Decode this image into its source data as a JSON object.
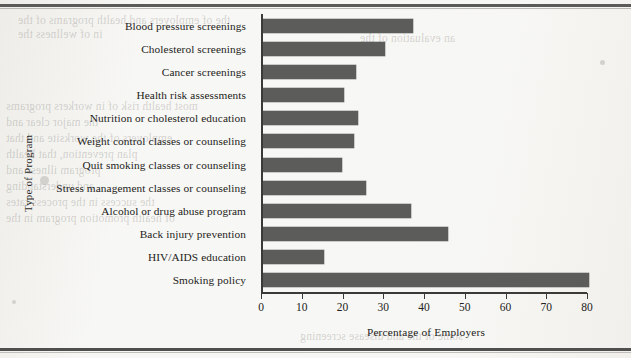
{
  "page": {
    "background_color": "#f7f7f5",
    "border_color": "#5a5a58",
    "ghost_text": [
      "the of employers and health programs of the",
      "in of wellness the",
      "most health risk of in workers programs",
      "the major clear and",
      "employers of the worksite and that",
      "plan prevention, that health",
      "program illness and",
      "and understanding",
      "the success in the process rates",
      "of health promotion program in the",
      "some of the and disease screening",
      "was in the of the",
      "an evaluation of the"
    ]
  },
  "chart_data": {
    "type": "bar",
    "orientation": "horizontal",
    "title": "",
    "xlabel": "Percentage of Employers",
    "ylabel": "Type of Program",
    "xlim": [
      0,
      80
    ],
    "xticks": [
      0,
      10,
      20,
      30,
      40,
      50,
      60,
      70,
      80
    ],
    "grid": false,
    "legend": false,
    "bar_color": "#5c5c5a",
    "categories": [
      "Blood pressure screenings",
      "Cholesterol screenings",
      "Cancer screenings",
      "Health risk assessments",
      "Nutrition or cholesterol education",
      "Weight control classes or counseling",
      "Quit smoking classes or counseling",
      "Stress management classes or counseling",
      "Alcohol or drug abuse program",
      "Back injury prevention",
      "HIV/AIDS education",
      "Smoking policy"
    ],
    "values": [
      37,
      30,
      23,
      20,
      23.5,
      22.5,
      19.5,
      25.5,
      36.5,
      45.5,
      15,
      80
    ]
  }
}
